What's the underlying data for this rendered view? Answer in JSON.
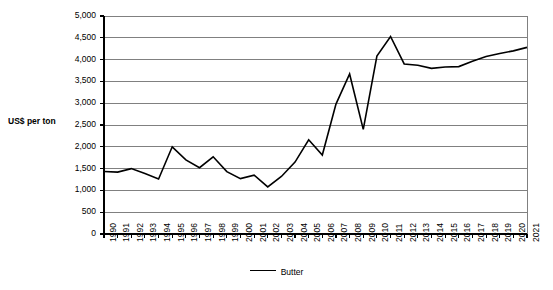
{
  "chart_data": {
    "type": "line",
    "title": "",
    "xlabel": "",
    "ylabel": "US$ per ton",
    "ylim": [
      0,
      5000
    ],
    "ytick_step": 500,
    "grid": true,
    "legend_position": "bottom",
    "line_color": "#000000",
    "gridline_color": "#808080",
    "categories": [
      "1990",
      "1991",
      "1992",
      "1993",
      "1994",
      "1995",
      "1996",
      "1997",
      "1998",
      "1999",
      "2000",
      "2001",
      "2002",
      "2003",
      "2004",
      "2005",
      "2006",
      "2007",
      "2008",
      "2009",
      "2010",
      "2011",
      "2012",
      "2013",
      "2014",
      "2015",
      "2016",
      "2017",
      "2018",
      "2019",
      "2020",
      "2021"
    ],
    "ytick_labels": [
      "0",
      "500",
      "1,000",
      "1,500",
      "2,000",
      "2,500",
      "3,000",
      "3,500",
      "4,000",
      "4,500",
      "5,000"
    ],
    "series": [
      {
        "name": "Butter",
        "values": [
          1435,
          1420,
          1500,
          1390,
          1260,
          2000,
          1700,
          1520,
          1770,
          1430,
          1270,
          1350,
          1080,
          1320,
          1650,
          2160,
          1810,
          2980,
          3670,
          2400,
          4080,
          4530,
          3900,
          3870,
          3800,
          3830,
          3840,
          3960,
          4070,
          4140,
          4200,
          4280
        ]
      }
    ]
  }
}
